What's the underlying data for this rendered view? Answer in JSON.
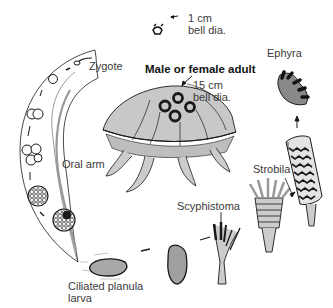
{
  "diagram": {
    "title": "Male or female adult",
    "labels": {
      "zygote": "Zygote",
      "oral_arm": "Oral arm",
      "adult_size_1": "15 cm",
      "adult_size_2": "bell dia.",
      "small_size_1": "1 cm",
      "small_size_2": "bell dia.",
      "ephyra": "Ephyra",
      "strobila": "Strobila",
      "scyphistoma": "Scyphistoma",
      "planula_1": "Ciliated planula",
      "planula_2": "larva"
    },
    "colors": {
      "ink": "#1a1a1a",
      "fill_gray": "#b8b8b8",
      "background": "#ffffff"
    }
  }
}
